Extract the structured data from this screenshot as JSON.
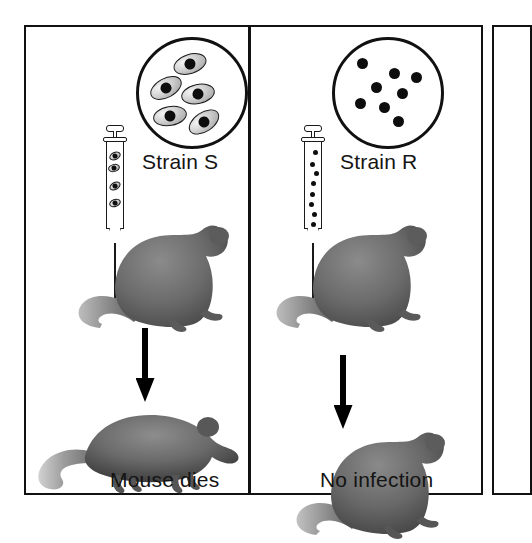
{
  "figure": {
    "panel_count": 2,
    "colors": {
      "ink": "#111111",
      "mouse_fill": "#6d6d6d",
      "mouse_shade": "#4a4a4a",
      "bacteria_core": "#0d0d0d",
      "capsule": "#cfcfcf",
      "background": "#ffffff"
    }
  },
  "columns": [
    {
      "id": "strain-s",
      "strain_label": "Strain S",
      "outcome_label": "Mouse dies",
      "scope": {
        "name": "microscope-view-strain-s",
        "bacteria_type": "encapsulated-smooth",
        "count": 5,
        "bacteria": [
          {
            "x": 34,
            "y": 14,
            "rot": -18
          },
          {
            "x": 10,
            "y": 38,
            "rot": -28
          },
          {
            "x": 42,
            "y": 44,
            "rot": -12
          },
          {
            "x": 14,
            "y": 66,
            "rot": -10
          },
          {
            "x": 48,
            "y": 72,
            "rot": -34
          }
        ]
      },
      "syringe": {
        "name": "syringe-strain-s",
        "contents_type": "encapsulated-smooth",
        "contents": [
          {
            "x": 5,
            "y": 10,
            "rot": -25
          },
          {
            "x": 3,
            "y": 22,
            "rot": -15
          },
          {
            "x": 4,
            "y": 40,
            "rot": -30
          },
          {
            "x": 4,
            "y": 57,
            "rot": -20
          }
        ]
      },
      "arrow": {
        "name": "arrow-down-strain-s",
        "direction": "down"
      },
      "mouse_top": {
        "name": "mouse-injected-strain-s",
        "state": "alive-sitting"
      },
      "mouse_bottom": {
        "name": "mouse-dead",
        "state": "dead-lying"
      }
    },
    {
      "id": "strain-r",
      "strain_label": "Strain R",
      "outcome_label": "No infection",
      "scope": {
        "name": "microscope-view-strain-r",
        "bacteria_type": "rough-unencapsulated",
        "count": 8,
        "bacteria": [
          {
            "x": 22,
            "y": 18
          },
          {
            "x": 54,
            "y": 28
          },
          {
            "x": 76,
            "y": 32
          },
          {
            "x": 36,
            "y": 42
          },
          {
            "x": 62,
            "y": 48
          },
          {
            "x": 20,
            "y": 58
          },
          {
            "x": 44,
            "y": 62
          },
          {
            "x": 58,
            "y": 76
          }
        ]
      },
      "syringe": {
        "name": "syringe-strain-r",
        "contents_type": "rough-unencapsulated",
        "contents": [
          {
            "x": 8,
            "y": 8
          },
          {
            "x": 5,
            "y": 20
          },
          {
            "x": 9,
            "y": 29
          },
          {
            "x": 6,
            "y": 39
          },
          {
            "x": 5,
            "y": 50
          },
          {
            "x": 4,
            "y": 60
          },
          {
            "x": 7,
            "y": 70
          },
          {
            "x": 6,
            "y": 80
          }
        ]
      },
      "arrow": {
        "name": "arrow-down-strain-r",
        "direction": "down"
      },
      "mouse_top": {
        "name": "mouse-injected-strain-r",
        "state": "alive-sitting"
      },
      "mouse_bottom": {
        "name": "mouse-healthy",
        "state": "alive-sitting"
      }
    }
  ]
}
